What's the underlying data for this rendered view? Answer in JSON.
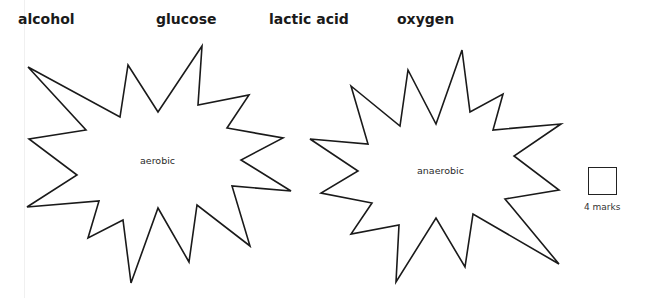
{
  "word_bank": [
    {
      "label": "alcohol"
    },
    {
      "label": "glucose"
    },
    {
      "label": "lactic acid"
    },
    {
      "label": "oxygen"
    }
  ],
  "shapes": [
    {
      "label": "aerobic",
      "stroke": "#1a1a1a"
    },
    {
      "label": "anaerobic",
      "stroke": "#1a1a1a"
    }
  ],
  "marks": {
    "label": "4 marks"
  }
}
